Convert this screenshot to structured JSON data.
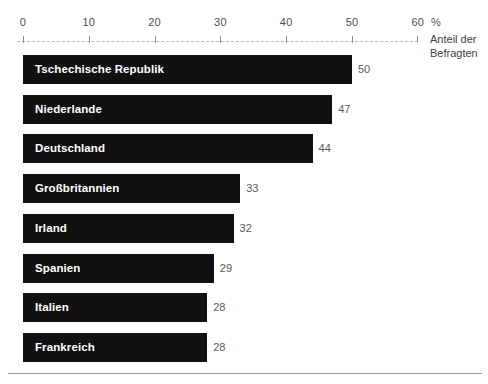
{
  "chart_data": {
    "type": "bar",
    "orientation": "horizontal",
    "title": "",
    "subtitle": "",
    "xlabel": "%",
    "ylabel": "",
    "axis_caption_lines": [
      "Anteil der",
      "Befragten"
    ],
    "percent_symbol": "%",
    "xlim": [
      0,
      60
    ],
    "xticks": [
      0,
      10,
      20,
      30,
      40,
      50,
      60
    ],
    "xtick_labels": [
      "0",
      "10",
      "20",
      "30",
      "40",
      "50",
      "60"
    ],
    "grid": false,
    "axis_style": "dashed",
    "legend": null,
    "categories": [
      "Tschechische Republik",
      "Niederlande",
      "Deutschland",
      "Großbritannien",
      "Irland",
      "Spanien",
      "Italien",
      "Frankreich"
    ],
    "values": [
      50,
      47,
      44,
      33,
      32,
      29,
      28,
      28
    ],
    "value_labels": [
      "50",
      "47",
      "44",
      "33",
      "32",
      "29",
      "28",
      "28"
    ],
    "colors": {
      "bar": "#111111",
      "bar_label_text": "#ffffff",
      "value_label_text": "#5a5a5a",
      "tick_label_text": "#4f4f4f",
      "axis_line": "#b9b9b9",
      "background": "#ffffff",
      "footer_rule": "#9a9a9a"
    },
    "bars": [
      {
        "category": "Tschechische Republik",
        "value": 50,
        "value_label": "50"
      },
      {
        "category": "Niederlande",
        "value": 47,
        "value_label": "47"
      },
      {
        "category": "Deutschland",
        "value": 44,
        "value_label": "44"
      },
      {
        "category": "Großbritannien",
        "value": 33,
        "value_label": "33"
      },
      {
        "category": "Irland",
        "value": 32,
        "value_label": "32"
      },
      {
        "category": "Spanien",
        "value": 29,
        "value_label": "29"
      },
      {
        "category": "Italien",
        "value": 28,
        "value_label": "28"
      },
      {
        "category": "Frankreich",
        "value": 28,
        "value_label": "28"
      }
    ]
  }
}
